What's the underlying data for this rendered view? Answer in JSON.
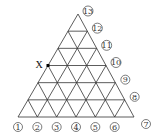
{
  "diagram": {
    "type": "triangular-lattice",
    "subdivisions": 6,
    "geometry": {
      "apex": [
        78,
        14
      ],
      "base_left": [
        18,
        117
      ],
      "base_right": [
        134,
        117
      ]
    },
    "line_color": "#333333",
    "point_marker": {
      "label": "X",
      "row_from_top": 3,
      "position": "left-edge"
    },
    "base_labels": [
      "1",
      "2",
      "3",
      "4",
      "5",
      "6",
      "7"
    ],
    "right_side_labels": [
      "8",
      "9",
      "10",
      "11",
      "12",
      "13"
    ]
  }
}
